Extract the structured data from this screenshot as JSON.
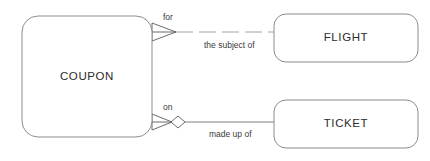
{
  "diagram": {
    "type": "entity-relationship-diagram",
    "notation": "crows-foot",
    "background_color": "#ffffff",
    "line_color": "#6f6f6f",
    "box_stroke_color": "#8d8d8d",
    "text_color": "#2b2b2b",
    "entities": [
      {
        "id": "coupon",
        "label": "COUPON",
        "x": 22,
        "y": 16,
        "width": 130,
        "height": 121,
        "corner_radius": 16
      },
      {
        "id": "flight",
        "label": "FLIGHT",
        "x": 274,
        "y": 14,
        "width": 144,
        "height": 48,
        "corner_radius": 12
      },
      {
        "id": "ticket",
        "label": "TICKET",
        "x": 274,
        "y": 100,
        "width": 144,
        "height": 48,
        "corner_radius": 12
      }
    ],
    "relationships": [
      {
        "id": "coupon-flight",
        "from": "coupon",
        "to": "flight",
        "line_style": "dashed",
        "from_marker": "crows-foot",
        "to_marker": "none",
        "near_label": "for",
        "far_label": "the subject of"
      },
      {
        "id": "coupon-ticket",
        "from": "coupon",
        "to": "ticket",
        "line_style": "solid",
        "from_marker": "crows-foot-diamond",
        "to_marker": "none",
        "near_label": "on",
        "far_label": "made up of"
      }
    ]
  }
}
